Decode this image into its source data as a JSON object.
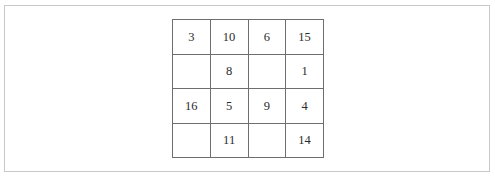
{
  "page": {
    "background_color": "#ffffff",
    "frame_color": "#c9c9c9"
  },
  "grid": {
    "name": "number-puzzle-grid",
    "rows": 4,
    "columns": 4,
    "line_color": "#6e6e6e",
    "text_color": "#2b2b2b",
    "cells": [
      [
        {
          "value": "3",
          "empty": false
        },
        {
          "value": "10",
          "empty": false
        },
        {
          "value": "6",
          "empty": false
        },
        {
          "value": "15",
          "empty": false
        }
      ],
      [
        {
          "value": "",
          "empty": true
        },
        {
          "value": "8",
          "empty": false
        },
        {
          "value": "",
          "empty": true
        },
        {
          "value": "1",
          "empty": false
        }
      ],
      [
        {
          "value": "16",
          "empty": false
        },
        {
          "value": "5",
          "empty": false
        },
        {
          "value": "9",
          "empty": false
        },
        {
          "value": "4",
          "empty": false
        }
      ],
      [
        {
          "value": "",
          "empty": true
        },
        {
          "value": "11",
          "empty": false
        },
        {
          "value": "",
          "empty": true
        },
        {
          "value": "14",
          "empty": false
        }
      ]
    ]
  }
}
